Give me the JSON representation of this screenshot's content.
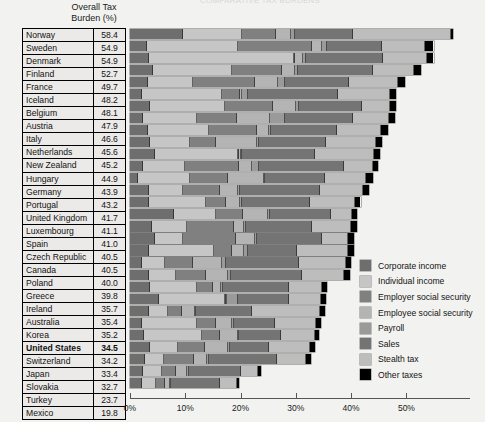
{
  "clipped_title": "COMPARATIVE TAX BURDENS",
  "column_header": "Overall Tax\nBurden (%)",
  "column_header_line1": "Overall Tax",
  "column_header_line2": "Burden (%)",
  "legend": {
    "items": [
      {
        "label": "Corporate income",
        "color": "#6e6e6e",
        "key": "corporate"
      },
      {
        "label": "Individual income",
        "color": "#c6c6c6",
        "key": "individual"
      },
      {
        "label": "Employer social security",
        "color": "#808080",
        "key": "employer_ss"
      },
      {
        "label": "Employee social security",
        "color": "#b4b4b4",
        "key": "employee_ss"
      },
      {
        "label": "Payroll",
        "color": "#9a9a9a",
        "key": "payroll"
      },
      {
        "label": "Sales",
        "color": "#747474",
        "key": "sales"
      },
      {
        "label": "Stealth tax",
        "color": "#bdbdbd",
        "key": "stealth"
      },
      {
        "label": "Other taxes",
        "color": "#000000",
        "key": "other"
      }
    ]
  },
  "chart_data": {
    "type": "bar",
    "orientation": "horizontal",
    "stacked": true,
    "title": "COMPARATIVE TAX BURDENS",
    "xlabel": "",
    "ylabel": "",
    "xlim": [
      0,
      60
    ],
    "grid": false,
    "legend_position": "right",
    "xticks": [
      0,
      10,
      20,
      30,
      40,
      50
    ],
    "xticklabels": [
      "0%",
      "10%",
      "20%",
      "30%",
      "40%",
      "50%"
    ],
    "value_column_header": "Overall Tax Burden (%)",
    "series": [
      {
        "name": "Corporate income",
        "color": "#6e6e6e"
      },
      {
        "name": "Individual income",
        "color": "#c6c6c6"
      },
      {
        "name": "Employer social security",
        "color": "#808080"
      },
      {
        "name": "Employee social security",
        "color": "#b4b4b4"
      },
      {
        "name": "Payroll",
        "color": "#9a9a9a"
      },
      {
        "name": "Sales",
        "color": "#747474"
      },
      {
        "name": "Stealth tax",
        "color": "#bdbdbd"
      },
      {
        "name": "Other taxes",
        "color": "#000000"
      }
    ],
    "rows": [
      {
        "country": "Norway",
        "total": 58.4,
        "bold": false,
        "segments": [
          9.5,
          10.7,
          6.3,
          2.7,
          0.6,
          10.6,
          17.6,
          0.4
        ]
      },
      {
        "country": "Sweden",
        "total": 54.9,
        "bold": false,
        "segments": [
          3.1,
          16.5,
          13.4,
          1.7,
          1.0,
          9.9,
          7.8,
          1.5
        ]
      },
      {
        "country": "Denmark",
        "total": 54.9,
        "bold": false,
        "segments": [
          3.5,
          26.1,
          0.2,
          1.5,
          0.6,
          13.8,
          8.1,
          1.1
        ]
      },
      {
        "country": "Finland",
        "total": 52.7,
        "bold": false,
        "segments": [
          4.2,
          14.3,
          9.0,
          2.3,
          0.6,
          13.6,
          7.4,
          1.3
        ]
      },
      {
        "country": "France",
        "total": 49.7,
        "bold": false,
        "segments": [
          3.3,
          8.1,
          11.3,
          4.1,
          1.3,
          11.5,
          8.9,
          1.2
        ]
      },
      {
        "country": "Iceland",
        "total": 48.2,
        "bold": false,
        "segments": [
          2.1,
          14.6,
          3.2,
          0.4,
          1.0,
          16.4,
          9.4,
          1.1
        ]
      },
      {
        "country": "Belgium",
        "total": 48.1,
        "bold": false,
        "segments": [
          3.6,
          13.6,
          8.7,
          4.2,
          0.4,
          11.4,
          5.2,
          1.0
        ]
      },
      {
        "country": "Austria",
        "total": 47.9,
        "bold": false,
        "segments": [
          2.4,
          9.8,
          7.2,
          6.0,
          2.6,
          12.4,
          6.4,
          1.1
        ]
      },
      {
        "country": "Italy",
        "total": 46.6,
        "bold": false,
        "segments": [
          3.2,
          11.1,
          8.6,
          2.3,
          0.4,
          11.9,
          7.9,
          1.2
        ]
      },
      {
        "country": "Netherlands",
        "total": 45.6,
        "bold": false,
        "segments": [
          3.6,
          7.3,
          4.6,
          7.5,
          0.4,
          12.1,
          9.0,
          1.1
        ]
      },
      {
        "country": "New Zealand",
        "total": 45.2,
        "bold": false,
        "segments": [
          4.6,
          15.0,
          0.2,
          0.2,
          0.3,
          13.1,
          10.7,
          1.1
        ]
      },
      {
        "country": "Hungary",
        "total": 44.9,
        "bold": false,
        "segments": [
          2.3,
          7.7,
          9.8,
          2.2,
          1.3,
          15.5,
          5.1,
          1.0
        ]
      },
      {
        "country": "Germany",
        "total": 43.9,
        "bold": false,
        "segments": [
          1.5,
          9.3,
          7.0,
          6.4,
          0.3,
          10.8,
          7.4,
          1.2
        ]
      },
      {
        "country": "Portugal",
        "total": 43.2,
        "bold": false,
        "segments": [
          3.4,
          6.2,
          6.7,
          3.3,
          0.3,
          14.4,
          7.9,
          1.0
        ]
      },
      {
        "country": "United Kingdom",
        "total": 41.7,
        "bold": false,
        "segments": [
          3.5,
          10.2,
          3.6,
          2.6,
          0.3,
          12.3,
          8.2,
          1.0
        ]
      },
      {
        "country": "Luxembourg",
        "total": 41.1,
        "bold": false,
        "segments": [
          8.0,
          7.6,
          4.8,
          4.6,
          0.3,
          11.1,
          3.7,
          1.0
        ]
      },
      {
        "country": "Spain",
        "total": 41.0,
        "bold": false,
        "segments": [
          3.9,
          6.4,
          8.5,
          1.9,
          0.3,
          12.0,
          6.9,
          1.1
        ]
      },
      {
        "country": "Czech Republic",
        "total": 40.5,
        "bold": false,
        "segments": [
          4.6,
          4.9,
          9.6,
          3.5,
          0.3,
          11.9,
          4.7,
          1.0
        ]
      },
      {
        "country": "Canada",
        "total": 40.5,
        "bold": false,
        "segments": [
          3.5,
          11.7,
          3.2,
          2.2,
          0.7,
          9.0,
          9.2,
          1.0
        ]
      },
      {
        "country": "Poland",
        "total": 40.0,
        "bold": false,
        "segments": [
          2.1,
          4.3,
          5.0,
          5.3,
          0.6,
          13.2,
          8.5,
          1.0
        ]
      },
      {
        "country": "Greece",
        "total": 39.8,
        "bold": false,
        "segments": [
          3.5,
          4.8,
          5.4,
          4.1,
          0.4,
          12.9,
          7.7,
          1.0
        ]
      },
      {
        "country": "Ireland",
        "total": 35.7,
        "bold": false,
        "segments": [
          3.7,
          8.4,
          3.0,
          1.4,
          0.3,
          12.0,
          6.0,
          0.9
        ]
      },
      {
        "country": "Australia",
        "total": 35.4,
        "bold": false,
        "segments": [
          5.3,
          11.9,
          0.2,
          0.2,
          2.0,
          9.2,
          5.8,
          0.8
        ]
      },
      {
        "country": "Korea",
        "total": 35.2,
        "bold": false,
        "segments": [
          3.5,
          3.4,
          2.5,
          2.3,
          0.3,
          10.0,
          12.3,
          0.9
        ]
      },
      {
        "country": "United States",
        "total": 34.5,
        "bold": true,
        "segments": [
          2.2,
          9.9,
          3.4,
          3.0,
          0.3,
          7.4,
          7.4,
          0.9
        ]
      },
      {
        "country": "Switzerland",
        "total": 34.2,
        "bold": false,
        "segments": [
          2.6,
          10.5,
          3.2,
          3.2,
          0.3,
          7.5,
          6.1,
          0.8
        ]
      },
      {
        "country": "Japan",
        "total": 33.4,
        "bold": false,
        "segments": [
          3.7,
          5.0,
          4.9,
          4.2,
          0.3,
          7.1,
          7.3,
          0.9
        ]
      },
      {
        "country": "Slovakia",
        "total": 32.7,
        "bold": false,
        "segments": [
          2.8,
          3.3,
          5.5,
          2.4,
          0.3,
          12.3,
          5.3,
          0.8
        ]
      },
      {
        "country": "Turkey",
        "total": 23.7,
        "bold": false,
        "segments": [
          2.3,
          3.5,
          2.5,
          2.1,
          0.3,
          9.4,
          3.1,
          0.5
        ]
      },
      {
        "country": "Mexico",
        "total": 19.8,
        "bold": false,
        "segments": [
          2.2,
          2.5,
          1.6,
          0.9,
          0.3,
          8.7,
          3.2,
          0.4
        ]
      }
    ]
  }
}
